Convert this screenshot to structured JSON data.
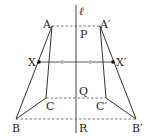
{
  "diagram": {
    "axis_label": "ℓ",
    "points": {
      "A": {
        "label": "A"
      },
      "A_prime": {
        "label": "A′"
      },
      "B": {
        "label": "B"
      },
      "B_prime": {
        "label": "B′"
      },
      "C": {
        "label": "C"
      },
      "C_prime": {
        "label": "C′"
      },
      "X": {
        "label": "X"
      },
      "X_prime": {
        "label": "X′"
      },
      "P": {
        "label": "P"
      },
      "Q": {
        "label": "Q"
      },
      "R": {
        "label": "R"
      }
    },
    "colors": {
      "line": "#333333",
      "dashed": "#555555",
      "tick": "#bbbbbb"
    }
  }
}
